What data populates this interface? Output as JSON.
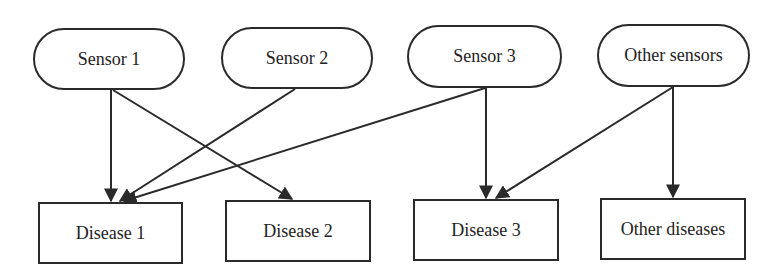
{
  "diagram": {
    "type": "bipartite-mapping",
    "sensors": [
      {
        "id": "s1",
        "label": "Sensor 1",
        "x": 33,
        "y": 28,
        "w": 152,
        "h": 62
      },
      {
        "id": "s2",
        "label": "Sensor 2",
        "x": 221,
        "y": 27,
        "w": 152,
        "h": 62
      },
      {
        "id": "s3",
        "label": "Sensor 3",
        "x": 407,
        "y": 25,
        "w": 155,
        "h": 63
      },
      {
        "id": "s4",
        "label": "Other sensors",
        "x": 597,
        "y": 24,
        "w": 153,
        "h": 63
      }
    ],
    "diseases": [
      {
        "id": "d1",
        "label": "Disease 1",
        "x": 38,
        "y": 202,
        "w": 145,
        "h": 62
      },
      {
        "id": "d2",
        "label": "Disease 2",
        "x": 225,
        "y": 200,
        "w": 146,
        "h": 62
      },
      {
        "id": "d3",
        "label": "Disease 3",
        "x": 413,
        "y": 199,
        "w": 146,
        "h": 62
      },
      {
        "id": "d4",
        "label": "Other diseases",
        "x": 600,
        "y": 198,
        "w": 146,
        "h": 62
      }
    ],
    "edges": [
      {
        "from": "Sensor 1",
        "to": "Disease 1",
        "x1": 111,
        "y1": 90,
        "x2": 111,
        "y2": 201
      },
      {
        "from": "Sensor 1",
        "to": "Disease 2",
        "x1": 113,
        "y1": 90,
        "x2": 292,
        "y2": 199
      },
      {
        "from": "Sensor 2",
        "to": "Disease 1",
        "x1": 295,
        "y1": 89,
        "x2": 120,
        "y2": 201
      },
      {
        "from": "Sensor 3",
        "to": "Disease 1",
        "x1": 485,
        "y1": 88,
        "x2": 124,
        "y2": 201
      },
      {
        "from": "Sensor 3",
        "to": "Disease 3",
        "x1": 486,
        "y1": 88,
        "x2": 486,
        "y2": 198
      },
      {
        "from": "Other sensors",
        "to": "Disease 3",
        "x1": 673,
        "y1": 87,
        "x2": 496,
        "y2": 198
      },
      {
        "from": "Other sensors",
        "to": "Other diseases",
        "x1": 673,
        "y1": 87,
        "x2": 673,
        "y2": 197
      }
    ],
    "colors": {
      "stroke": "#2a2a2a",
      "text": "#222222",
      "background": "#ffffff"
    }
  }
}
